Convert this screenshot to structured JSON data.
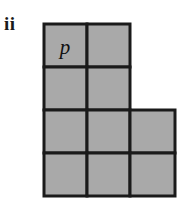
{
  "figure": {
    "part_label": "ii",
    "background_color": "#ffffff",
    "cell_fill_color": "#a9a9a9",
    "cell_stroke_color": "#1a1a1a",
    "stroke_width": 3,
    "cell_size": 43,
    "origin": {
      "x": 44,
      "y": 24
    },
    "grid_x_lines": [
      44,
      87,
      130,
      175
    ],
    "grid_y_lines": [
      24,
      67,
      110,
      153,
      196
    ],
    "rows": 4,
    "columns": 3,
    "cells": [
      {
        "id": "r1c1",
        "row": 0,
        "col": 0,
        "x": 44,
        "y": 24,
        "w": 43,
        "h": 43,
        "label": "p"
      },
      {
        "id": "r1c2",
        "row": 0,
        "col": 1,
        "x": 87,
        "y": 24,
        "w": 43,
        "h": 43,
        "label": ""
      },
      {
        "id": "r2c1",
        "row": 1,
        "col": 0,
        "x": 44,
        "y": 67,
        "w": 43,
        "h": 43,
        "label": ""
      },
      {
        "id": "r2c2",
        "row": 1,
        "col": 1,
        "x": 87,
        "y": 67,
        "w": 43,
        "h": 43,
        "label": ""
      },
      {
        "id": "r3c1",
        "row": 2,
        "col": 0,
        "x": 44,
        "y": 110,
        "w": 43,
        "h": 43,
        "label": ""
      },
      {
        "id": "r3c2",
        "row": 2,
        "col": 1,
        "x": 87,
        "y": 110,
        "w": 43,
        "h": 43,
        "label": ""
      },
      {
        "id": "r3c3",
        "row": 2,
        "col": 2,
        "x": 130,
        "y": 110,
        "w": 45,
        "h": 43,
        "label": ""
      },
      {
        "id": "r4c1",
        "row": 3,
        "col": 0,
        "x": 44,
        "y": 153,
        "w": 43,
        "h": 43,
        "label": ""
      },
      {
        "id": "r4c2",
        "row": 3,
        "col": 1,
        "x": 87,
        "y": 153,
        "w": 43,
        "h": 43,
        "label": ""
      },
      {
        "id": "r4c3",
        "row": 3,
        "col": 2,
        "x": 130,
        "y": 153,
        "w": 45,
        "h": 43,
        "label": ""
      }
    ],
    "labels": {
      "p": {
        "text": "p",
        "x": 65,
        "y": 54
      }
    }
  }
}
